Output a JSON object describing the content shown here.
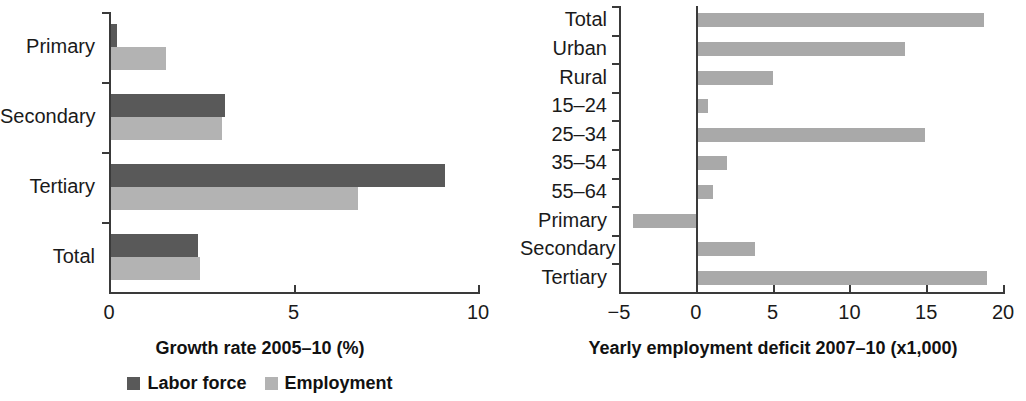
{
  "colors": {
    "dark_series": "#595959",
    "light_series": "#b3b3b3",
    "right_bars": "#a9a9a9",
    "axis": "#3a3a3a",
    "text": "#1a1a1a"
  },
  "legend": {
    "items": [
      {
        "label": "Labor force",
        "color": "#595959"
      },
      {
        "label": "Employment",
        "color": "#b3b3b3"
      }
    ]
  },
  "chart_data": [
    {
      "id": "growth-rate",
      "type": "bar",
      "orientation": "horizontal",
      "title": "",
      "xlabel": "Growth rate 2005–10 (%)",
      "ylabel": "",
      "xlim": [
        0,
        10
      ],
      "xticks": [
        0,
        5,
        10
      ],
      "xtick_labels": [
        "0",
        "5",
        "10"
      ],
      "grid": false,
      "legend_position": "bottom",
      "categories": [
        "Primary",
        "Secondary",
        "Tertiary",
        "Total"
      ],
      "series": [
        {
          "name": "Labor force",
          "color": "#595959",
          "values": [
            0.15,
            3.1,
            9.05,
            2.35
          ]
        },
        {
          "name": "Employment",
          "color": "#b3b3b3",
          "values": [
            1.5,
            3.0,
            6.7,
            2.4
          ]
        }
      ]
    },
    {
      "id": "employment-deficit",
      "type": "bar",
      "orientation": "horizontal",
      "title": "",
      "xlabel": "Yearly employment deficit 2007–10 (x1,000)",
      "ylabel": "",
      "xlim": [
        -5,
        20
      ],
      "xticks": [
        -5,
        0,
        5,
        10,
        15,
        20
      ],
      "xtick_labels": [
        "−5",
        "0",
        "5",
        "10",
        "15",
        "20"
      ],
      "grid": false,
      "legend_position": "none",
      "categories": [
        "Total",
        "Urban",
        "Rural",
        "15–24",
        "25–34",
        "35–54",
        "55–64",
        "Primary",
        "Secondary",
        "Tertiary"
      ],
      "series": [
        {
          "name": "Yearly employment deficit",
          "color": "#a9a9a9",
          "values": [
            18.6,
            13.5,
            4.9,
            0.65,
            14.8,
            1.9,
            1.0,
            -4.1,
            3.7,
            18.8
          ]
        }
      ]
    }
  ]
}
